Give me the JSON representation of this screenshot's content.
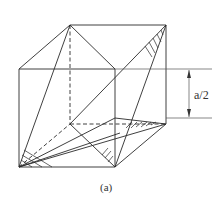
{
  "figure": {
    "dimension_label": "a/2",
    "caption": "(a)"
  }
}
